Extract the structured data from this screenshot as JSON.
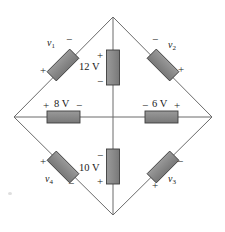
{
  "figure": {
    "background_color": "#ffffff",
    "wire_color": "#6b6b6b",
    "resistor_fill": "#8a8a8a",
    "resistor_stroke": "#3d3d3d",
    "text_color": "#1a1a1a"
  },
  "nodes": {
    "top": {
      "x": 113,
      "y": 17
    },
    "left": {
      "x": 14,
      "y": 117
    },
    "right": {
      "x": 212,
      "y": 117
    },
    "bottom": {
      "x": 113,
      "y": 215
    },
    "center": {
      "x": 113,
      "y": 117
    }
  },
  "elements": [
    {
      "id": "v1",
      "label": "v",
      "subscript": "1",
      "orientation": "diagonal-up-right",
      "plus_sign": "+",
      "minus_sign": "−",
      "plus_position": "lower-left",
      "minus_position": "upper-right",
      "branch": "top-left"
    },
    {
      "id": "v2",
      "label": "v",
      "subscript": "2",
      "orientation": "diagonal-down-right",
      "plus_sign": "+",
      "minus_sign": "−",
      "plus_position": "lower-right",
      "minus_position": "upper-left",
      "branch": "top-right"
    },
    {
      "id": "v3",
      "label": "v",
      "subscript": "3",
      "orientation": "diagonal-up-right",
      "plus_sign": "+",
      "minus_sign": "−",
      "plus_position": "lower-left",
      "minus_position": "upper-right",
      "branch": "bottom-right"
    },
    {
      "id": "v4",
      "label": "v",
      "subscript": "4",
      "orientation": "diagonal-down-right",
      "plus_sign": "+",
      "minus_sign": "−",
      "plus_position": "upper-left",
      "minus_position": "lower-right",
      "branch": "bottom-left"
    },
    {
      "id": "source12",
      "label": "12 V",
      "orientation": "vertical",
      "plus_sign": "+",
      "minus_sign": "−",
      "plus_position": "top-left",
      "minus_position": "bottom-left",
      "branch": "center-upper"
    },
    {
      "id": "source10",
      "label": "10 V",
      "orientation": "vertical",
      "plus_sign": "+",
      "minus_sign": "−",
      "plus_position": "bottom-left",
      "minus_position": "top-left",
      "branch": "center-lower"
    },
    {
      "id": "source8",
      "label": "8 V",
      "orientation": "horizontal",
      "plus_sign": "+",
      "minus_sign": "−",
      "plus_position": "above-left",
      "minus_position": "above-right",
      "branch": "center-left"
    },
    {
      "id": "source6",
      "label": "6 V",
      "orientation": "horizontal",
      "plus_sign": "+",
      "minus_sign": "−",
      "plus_position": "above-right",
      "minus_position": "above-left",
      "branch": "center-right"
    }
  ]
}
